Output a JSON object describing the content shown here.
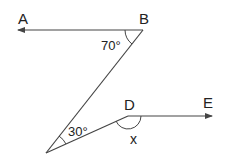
{
  "diagram": {
    "points": {
      "A": {
        "label": "A"
      },
      "B": {
        "label": "B"
      },
      "D": {
        "label": "D"
      },
      "E": {
        "label": "E"
      }
    },
    "angles": {
      "angle_B": "70°",
      "angle_bottom": "30°",
      "angle_D": "x"
    },
    "colors": {
      "line": "#444444",
      "text": "#222222"
    }
  }
}
